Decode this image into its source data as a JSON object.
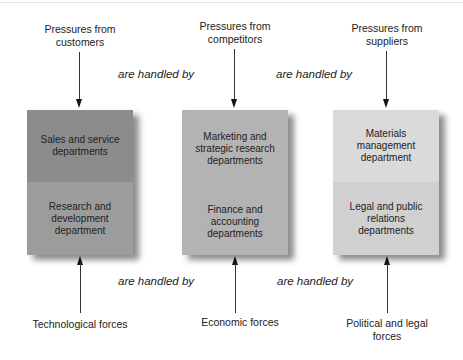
{
  "diagram": {
    "connector_label": "are handled by",
    "columns": [
      {
        "top_pressure": "Pressures from customers",
        "top_department": "Sales and service departments",
        "bottom_department": "Research and development department",
        "bottom_force": "Technological forces",
        "colors": {
          "top": "#8c8c8c",
          "bottom": "#9c9c9c"
        }
      },
      {
        "top_pressure": "Pressures from competitors",
        "top_department": "Marketing and strategic research departments",
        "bottom_department": "Finance and accounting departments",
        "bottom_force": "Economic forces",
        "colors": {
          "top": "#b3b3b3",
          "bottom": "#b3b3b3"
        }
      },
      {
        "top_pressure": "Pressures from suppliers",
        "top_department": "Materials management department",
        "bottom_department": "Legal and public relations departments",
        "bottom_force": "Political and legal forces",
        "colors": {
          "top": "#dadada",
          "bottom": "#d0d0d0"
        }
      }
    ]
  }
}
